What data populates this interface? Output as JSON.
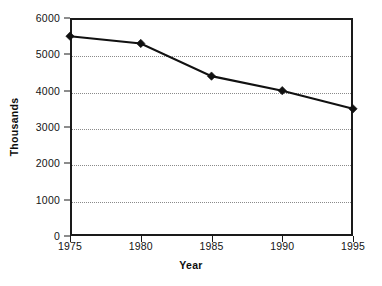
{
  "chart_data": {
    "type": "line",
    "title": "",
    "subtitle": "",
    "xlabel": "Year",
    "ylabel": "Thousands",
    "x": [
      1975,
      1980,
      1985,
      1990,
      1995
    ],
    "categories": [
      "1975",
      "1980",
      "1985",
      "1990",
      "1995"
    ],
    "values": [
      5500,
      5300,
      4400,
      4000,
      3500
    ],
    "series": [
      {
        "name": "",
        "values": [
          5500,
          5300,
          4400,
          4000,
          3500
        ]
      }
    ],
    "xlim": [
      1975,
      1995
    ],
    "ylim": [
      0,
      6000
    ],
    "ytick_step": 1000,
    "ytick_labels": [
      "0",
      "1000",
      "2000",
      "3000",
      "4000",
      "5000",
      "6000"
    ],
    "ytick_values": [
      0,
      1000,
      2000,
      3000,
      4000,
      5000,
      6000
    ],
    "xtick_labels": [
      "1975",
      "1980",
      "1985",
      "1990",
      "1995"
    ],
    "grid": {
      "horizontal": true,
      "vertical": false,
      "style": "dotted"
    },
    "legend": {
      "visible": false,
      "position": "none"
    },
    "marker": "filled-diamond",
    "colors": {
      "line": "#111111",
      "marker": "#111111",
      "axis": "#1a1a1a",
      "grid": "#8a8a8a",
      "background": "#ffffff",
      "text": "#141414"
    }
  }
}
